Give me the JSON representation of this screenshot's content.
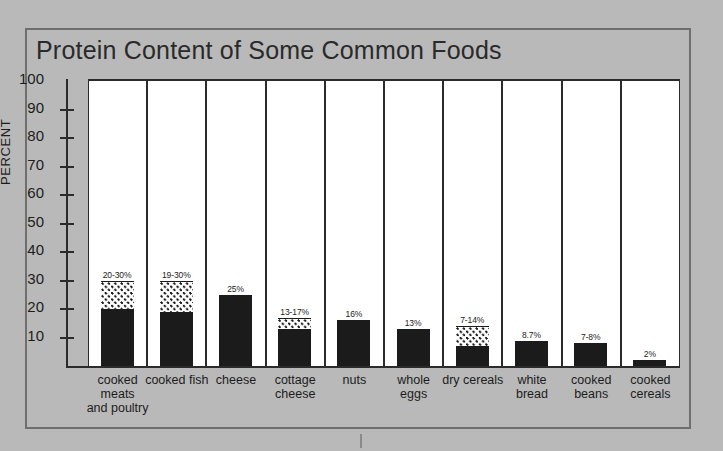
{
  "chart_data": {
    "type": "bar",
    "title": "Protein Content of Some Common Foods",
    "xlabel": "",
    "ylabel": "PERCENT",
    "ylim": [
      0,
      100
    ],
    "yticks": [
      10,
      20,
      30,
      40,
      50,
      60,
      70,
      80,
      90,
      100
    ],
    "grid": false,
    "legend": "none",
    "categories": [
      "cooked\nmeats\nand poultry",
      "cooked fish",
      "cheese",
      "cottage\ncheese",
      "nuts",
      "whole\neggs",
      "dry cereals",
      "white\nbread",
      "cooked\nbeans",
      "cooked\ncereals"
    ],
    "values": [
      30,
      30,
      25,
      17,
      16,
      13,
      14,
      8.7,
      8,
      2
    ],
    "series": [
      {
        "name": "minimum (solid)",
        "values": [
          20,
          19,
          25,
          13,
          16,
          13,
          7,
          8.7,
          7,
          2
        ]
      },
      {
        "name": "maximum (dotted range top)",
        "values": [
          30,
          30,
          25,
          17,
          16,
          13,
          14,
          8.7,
          8,
          2
        ]
      }
    ],
    "bars": [
      {
        "category": "cooked meats and poultry",
        "label": "cooked\nmeats\nand poultry",
        "solid_value": 20,
        "range_top": 30,
        "has_range": true,
        "value_label": "20-30%"
      },
      {
        "category": "cooked fish",
        "label": "cooked fish",
        "solid_value": 19,
        "range_top": 30,
        "has_range": true,
        "value_label": "19-30%"
      },
      {
        "category": "cheese",
        "label": "cheese",
        "solid_value": 25,
        "range_top": 25,
        "has_range": false,
        "value_label": "25%"
      },
      {
        "category": "cottage cheese",
        "label": "cottage\ncheese",
        "solid_value": 13,
        "range_top": 17,
        "has_range": true,
        "value_label": "13-17%"
      },
      {
        "category": "nuts",
        "label": "nuts",
        "solid_value": 16,
        "range_top": 16,
        "has_range": false,
        "value_label": "16%"
      },
      {
        "category": "whole eggs",
        "label": "whole\neggs",
        "solid_value": 13,
        "range_top": 13,
        "has_range": false,
        "value_label": "13%"
      },
      {
        "category": "dry cereals",
        "label": "dry cereals",
        "solid_value": 7,
        "range_top": 14,
        "has_range": true,
        "value_label": "7-14%"
      },
      {
        "category": "white bread",
        "label": "white\nbread",
        "solid_value": 8.7,
        "range_top": 8.7,
        "has_range": false,
        "value_label": "8.7%"
      },
      {
        "category": "cooked beans",
        "label": "cooked\nbeans",
        "solid_value": 8,
        "range_top": 8,
        "has_range": false,
        "value_label": "7-8%"
      },
      {
        "category": "cooked cereals",
        "label": "cooked\ncereals",
        "solid_value": 2,
        "range_top": 2,
        "has_range": false,
        "value_label": "2%"
      }
    ]
  },
  "colors": {
    "page_background": "#b9b9b9",
    "frame_border": "#6e6e6e",
    "plot_background": "#ffffff",
    "bar_solid": "#1b1b1b",
    "axis": "#2b2b2b",
    "text": "#1c1c1c"
  }
}
